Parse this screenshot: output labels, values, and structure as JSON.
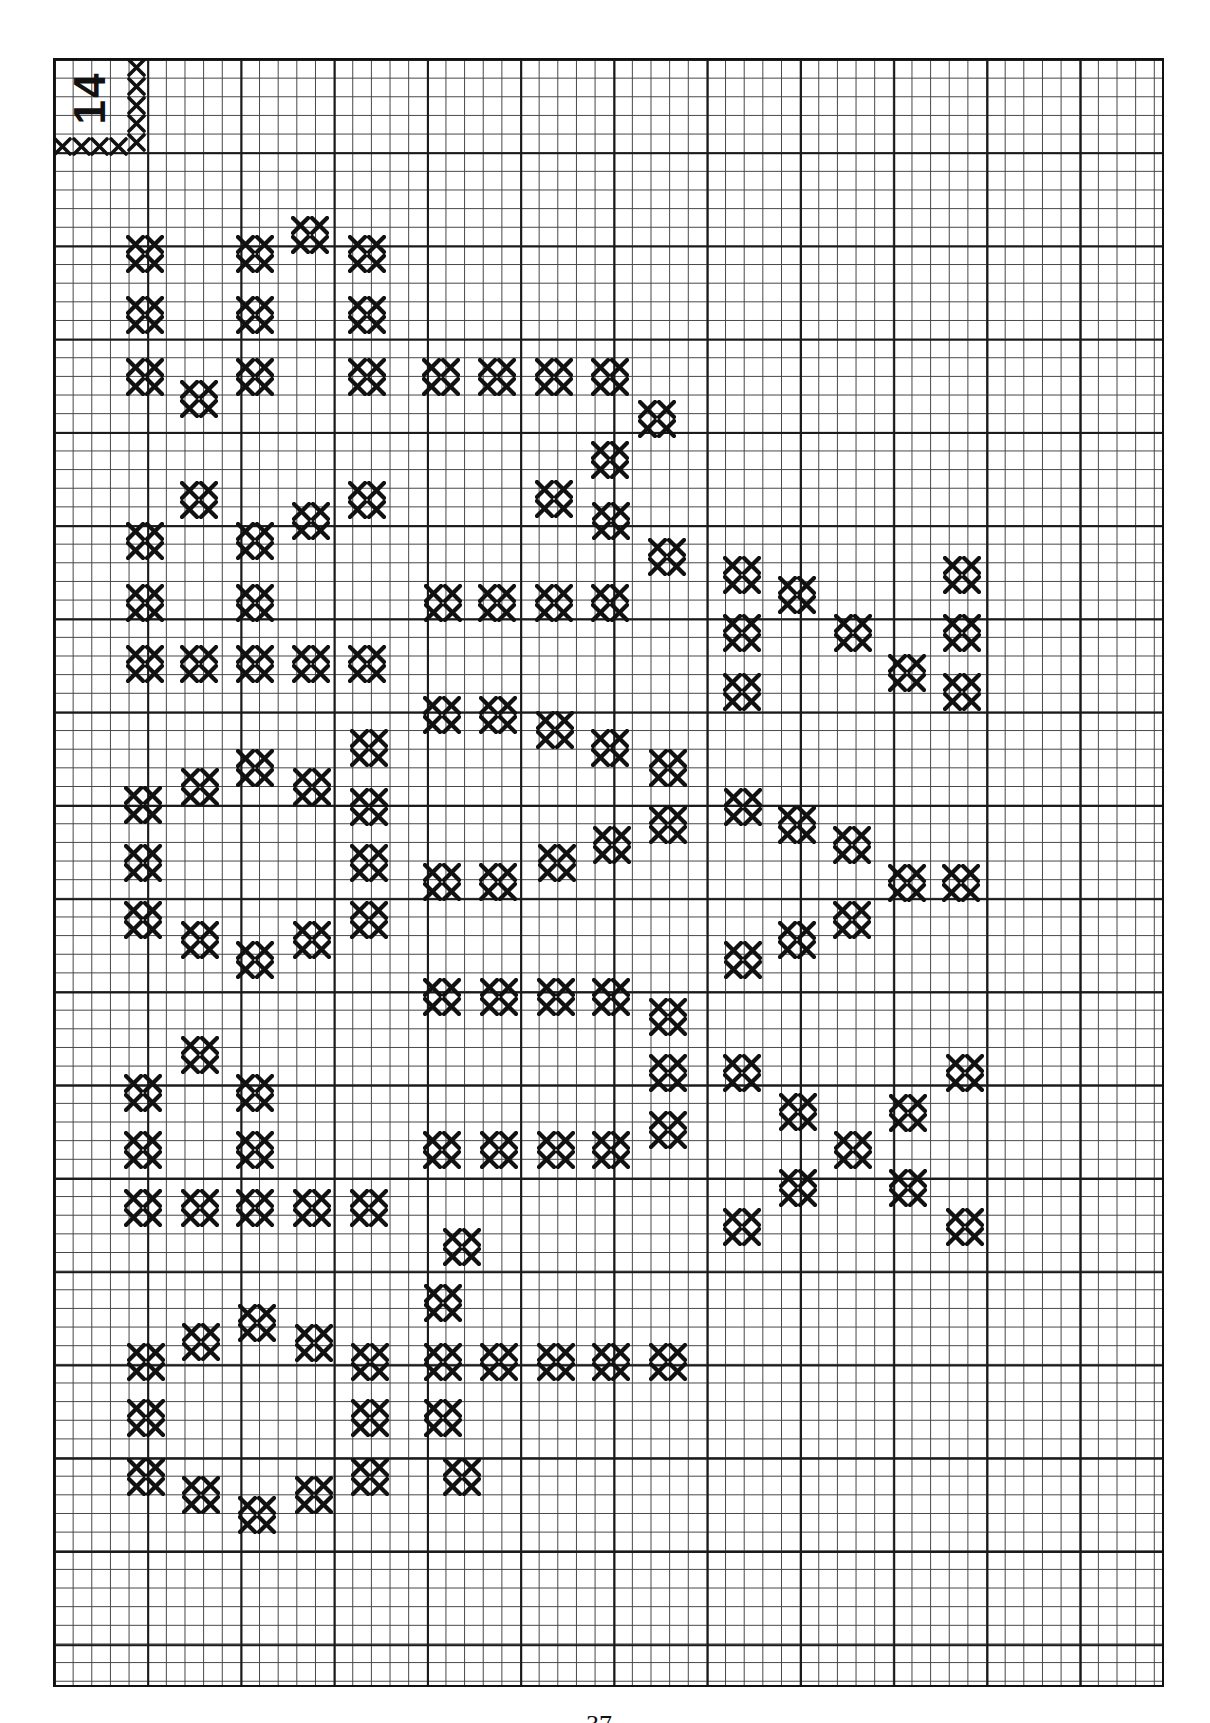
{
  "page": {
    "corner_label": "14",
    "page_number": "37",
    "ink_color": "#111111",
    "grid": {
      "left": 53,
      "top": 58,
      "width": 1111,
      "height": 1629,
      "cell": 18.65,
      "major_every": 5
    }
  },
  "corner_border": {
    "vertical": [
      [
        127,
        58
      ],
      [
        127,
        77
      ],
      [
        127,
        96
      ],
      [
        127,
        114
      ],
      [
        127,
        133
      ]
    ],
    "horizontal": [
      [
        53,
        137
      ],
      [
        72,
        137
      ],
      [
        90,
        137
      ],
      [
        109,
        137
      ]
    ]
  },
  "motifs": [
    {
      "name": "motif-w",
      "marks": [
        [
          145,
          254
        ],
        [
          255,
          254
        ],
        [
          310,
          235
        ],
        [
          367,
          254
        ],
        [
          145,
          315
        ],
        [
          255,
          315
        ],
        [
          367,
          315
        ],
        [
          145,
          377
        ],
        [
          199,
          399
        ],
        [
          255,
          377
        ],
        [
          367,
          377
        ]
      ]
    },
    {
      "name": "motif-three-top",
      "marks": [
        [
          441,
          377
        ],
        [
          497,
          377
        ],
        [
          554,
          377
        ],
        [
          610,
          377
        ],
        [
          657,
          419
        ],
        [
          610,
          460
        ],
        [
          554,
          499
        ],
        [
          611,
          521
        ],
        [
          667,
          557
        ],
        [
          610,
          603
        ],
        [
          554,
          603
        ],
        [
          497,
          603
        ],
        [
          443,
          603
        ]
      ]
    },
    {
      "name": "motif-e-upper",
      "marks": [
        [
          199,
          500
        ],
        [
          311,
          521
        ],
        [
          367,
          500
        ],
        [
          145,
          541
        ],
        [
          255,
          541
        ],
        [
          145,
          603
        ],
        [
          255,
          603
        ],
        [
          145,
          664
        ],
        [
          199,
          664
        ],
        [
          255,
          664
        ],
        [
          311,
          664
        ],
        [
          367,
          664
        ]
      ]
    },
    {
      "name": "motif-sigma-upper",
      "marks": [
        [
          742,
          575
        ],
        [
          797,
          595
        ],
        [
          853,
          633
        ],
        [
          962,
          575
        ],
        [
          742,
          633
        ],
        [
          962,
          633
        ],
        [
          907,
          673
        ],
        [
          742,
          692
        ],
        [
          962,
          692
        ]
      ]
    },
    {
      "name": "motif-o-upper",
      "marks": [
        [
          143,
          805
        ],
        [
          200,
          787
        ],
        [
          255,
          768
        ],
        [
          312,
          787
        ],
        [
          369,
          748
        ],
        [
          369,
          807
        ],
        [
          143,
          863
        ],
        [
          369,
          863
        ],
        [
          143,
          920
        ],
        [
          200,
          940
        ],
        [
          255,
          960
        ],
        [
          312,
          940
        ],
        [
          369,
          920
        ]
      ]
    },
    {
      "name": "motif-three-middle",
      "marks": [
        [
          442,
          715
        ],
        [
          498,
          715
        ],
        [
          555,
          730
        ],
        [
          610,
          748
        ],
        [
          668,
          768
        ],
        [
          668,
          825
        ],
        [
          612,
          845
        ],
        [
          557,
          863
        ],
        [
          442,
          882
        ],
        [
          498,
          882
        ]
      ]
    },
    {
      "name": "motif-sigma-middle",
      "marks": [
        [
          743,
          807
        ],
        [
          797,
          825
        ],
        [
          852,
          845
        ],
        [
          907,
          883
        ],
        [
          961,
          883
        ],
        [
          852,
          920
        ],
        [
          797,
          940
        ],
        [
          743,
          960
        ]
      ]
    },
    {
      "name": "motif-e-lower",
      "marks": [
        [
          200,
          1055
        ],
        [
          143,
          1093
        ],
        [
          255,
          1093
        ],
        [
          143,
          1150
        ],
        [
          255,
          1150
        ],
        [
          143,
          1208
        ],
        [
          200,
          1208
        ],
        [
          255,
          1208
        ],
        [
          312,
          1208
        ],
        [
          369,
          1208
        ]
      ]
    },
    {
      "name": "motif-b-lower",
      "marks": [
        [
          442,
          997
        ],
        [
          499,
          997
        ],
        [
          556,
          997
        ],
        [
          611,
          997
        ],
        [
          668,
          1017
        ],
        [
          668,
          1073
        ],
        [
          668,
          1130
        ],
        [
          442,
          1150
        ],
        [
          499,
          1150
        ],
        [
          556,
          1150
        ],
        [
          611,
          1150
        ]
      ]
    },
    {
      "name": "motif-x-lower",
      "marks": [
        [
          742,
          1073
        ],
        [
          798,
          1112
        ],
        [
          853,
          1150
        ],
        [
          908,
          1113
        ],
        [
          965,
          1073
        ],
        [
          798,
          1188
        ],
        [
          908,
          1188
        ],
        [
          742,
          1227
        ],
        [
          965,
          1227
        ]
      ]
    },
    {
      "name": "motif-o-bottom",
      "marks": [
        [
          146,
          1362
        ],
        [
          201,
          1342
        ],
        [
          257,
          1323
        ],
        [
          314,
          1343
        ],
        [
          370,
          1362
        ],
        [
          146,
          1418
        ],
        [
          370,
          1418
        ],
        [
          146,
          1477
        ],
        [
          201,
          1495
        ],
        [
          257,
          1515
        ],
        [
          314,
          1495
        ],
        [
          370,
          1477
        ]
      ]
    },
    {
      "name": "motif-arrow-bottom",
      "marks": [
        [
          462,
          1247
        ],
        [
          443,
          1303
        ],
        [
          443,
          1362
        ],
        [
          499,
          1362
        ],
        [
          556,
          1362
        ],
        [
          611,
          1362
        ],
        [
          668,
          1362
        ],
        [
          443,
          1418
        ],
        [
          462,
          1477
        ]
      ]
    }
  ]
}
